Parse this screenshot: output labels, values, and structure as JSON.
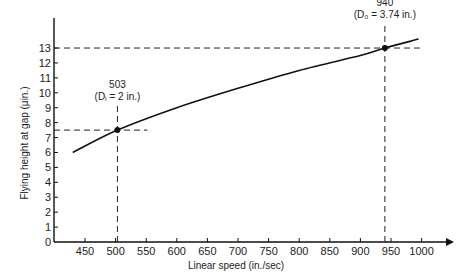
{
  "chart_data": {
    "type": "line",
    "title": "",
    "xlabel": "Linear speed (in./sec)",
    "ylabel": "Flying height at gap (μin.)",
    "xlim": [
      400,
      1050
    ],
    "ylim": [
      0,
      14
    ],
    "x_ticks": [
      450,
      500,
      550,
      600,
      650,
      700,
      750,
      800,
      850,
      900,
      950,
      1000
    ],
    "x_tick_labels": [
      "450",
      "500",
      "550",
      "600",
      "650",
      "700",
      "750",
      "800",
      "850",
      "900",
      "950",
      "1000"
    ],
    "y_ticks": [
      0,
      1,
      2,
      3,
      4,
      5,
      6,
      7,
      8,
      9,
      10,
      11,
      12,
      13
    ],
    "y_tick_labels": [
      "0",
      "1",
      "2",
      "3",
      "4",
      "5",
      "6",
      "7",
      "8",
      "9",
      "10",
      "11",
      "12",
      "13"
    ],
    "grid": false,
    "legend": null,
    "series": [
      {
        "name": "Flying height vs linear speed",
        "x": [
          430,
          503,
          600,
          700,
          800,
          900,
          940,
          995
        ],
        "y": [
          6.0,
          7.5,
          9.0,
          10.3,
          11.5,
          12.5,
          13.0,
          13.6
        ]
      }
    ],
    "annotations": [
      {
        "x": 503,
        "y": 7.5,
        "label": "503",
        "sublabel": "(Dᵢ = 2 in.)"
      },
      {
        "x": 940,
        "y": 13.0,
        "label": "940",
        "sublabel": "(D₀ = 3.74 in.)"
      }
    ]
  }
}
